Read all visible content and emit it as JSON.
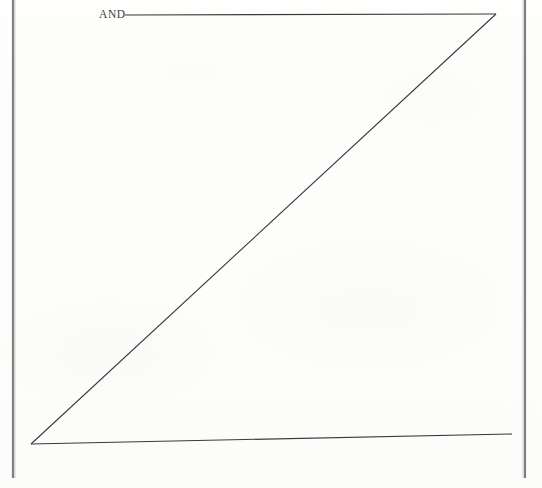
{
  "page": {
    "width": 542,
    "height": 488,
    "background_color": "#fdfdfc",
    "ink_color": "#3a3a3c",
    "rule_color": "#6a6a6c"
  },
  "labels": {
    "and": "AND"
  },
  "chart_data": {
    "type": "line",
    "title": "AND",
    "subtitle": "",
    "xlabel": "",
    "ylabel": "",
    "grid": false,
    "legend_position": "none",
    "axis_ranges": {
      "x": [
        0,
        542
      ],
      "y": [
        0,
        488
      ]
    },
    "annotations": [
      {
        "name": "and-label",
        "text": "AND",
        "x": 99,
        "y": 14,
        "anchor": "start"
      }
    ],
    "series": [
      {
        "name": "top-horizontal-line",
        "kind": "segment",
        "points": [
          {
            "x": 125,
            "y": 15
          },
          {
            "x": 496,
            "y": 14
          }
        ],
        "stroke": "#3a3a3c",
        "stroke_width": 1.1
      },
      {
        "name": "diagonal-hypotenuse",
        "kind": "segment",
        "points": [
          {
            "x": 496,
            "y": 14
          },
          {
            "x": 31,
            "y": 444
          }
        ],
        "stroke": "#3a3a3c",
        "stroke_width": 1.1
      },
      {
        "name": "baseline-line",
        "kind": "segment",
        "points": [
          {
            "x": 31,
            "y": 444
          },
          {
            "x": 512,
            "y": 434
          }
        ],
        "stroke": "#3a3a3c",
        "stroke_width": 1.1
      }
    ],
    "rules": [
      {
        "name": "left-page-rule",
        "kind": "segment",
        "points": [
          {
            "x": 13,
            "y": 0
          },
          {
            "x": 13,
            "y": 478
          }
        ],
        "stroke": "#6a6a6c",
        "stroke_width": 2.2
      },
      {
        "name": "right-page-rule",
        "kind": "segment",
        "points": [
          {
            "x": 525,
            "y": 0
          },
          {
            "x": 525,
            "y": 478
          }
        ],
        "stroke": "#6a6a6c",
        "stroke_width": 2.2
      }
    ]
  }
}
